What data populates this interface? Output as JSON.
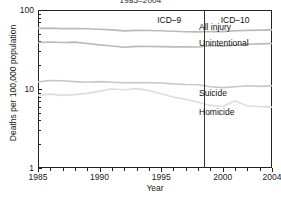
{
  "chart_data": {
    "type": "line",
    "title": "1985–2004",
    "xlabel": "Year",
    "ylabel": "Deaths per 100,000 population",
    "yscale": "log",
    "ylim": [
      1,
      100
    ],
    "xlim": [
      1985,
      2004
    ],
    "grid": false,
    "legend_position": "inline-right",
    "y_tick_labels": [
      "100",
      "10",
      "1"
    ],
    "y_tick_values": [
      100,
      10,
      1
    ],
    "y_minor_ticks": [
      20,
      30,
      40,
      50,
      60,
      70,
      80,
      90,
      2,
      3,
      4,
      5,
      6,
      7,
      8,
      9
    ],
    "x_tick_labels": [
      "1985",
      "1990",
      "1995",
      "2000",
      "2004"
    ],
    "x_tick_values": [
      1985,
      1990,
      1995,
      2000,
      2004
    ],
    "x_minor_ticks": [
      1986,
      1987,
      1988,
      1989,
      1991,
      1992,
      1993,
      1994,
      1996,
      1997,
      1998,
      1999,
      2001,
      2002,
      2003
    ],
    "annotations": [
      {
        "name": "icd9",
        "text": "ICD–9",
        "x": 1996.3,
        "y": 86
      },
      {
        "name": "icd10",
        "text": "ICD–10",
        "x": 2001.3,
        "y": 86
      }
    ],
    "vertical_divider": {
      "x": 1998.5,
      "label": "ICD revision change"
    },
    "x": [
      1985,
      1986,
      1987,
      1988,
      1989,
      1990,
      1991,
      1992,
      1993,
      1994,
      1995,
      1996,
      1997,
      1998,
      1999,
      2000,
      2001,
      2002,
      2003,
      2004
    ],
    "series": [
      {
        "name": "All injury",
        "color": "#b9b9b9",
        "values": [
          58.6,
          58.9,
          58.1,
          58.3,
          57.8,
          57.0,
          56.1,
          54.4,
          55.2,
          55.0,
          54.6,
          53.8,
          53.0,
          52.8,
          53.4,
          53.2,
          54.6,
          55.2,
          55.7,
          56.0
        ]
      },
      {
        "name": "Unintentional",
        "color": "#b9b9b9",
        "values": [
          38.8,
          39.3,
          38.8,
          39.2,
          37.6,
          36.2,
          35.0,
          33.8,
          34.6,
          34.5,
          34.4,
          34.1,
          34.3,
          34.0,
          35.4,
          34.9,
          35.8,
          36.8,
          37.3,
          37.7
        ]
      },
      {
        "name": "Suicide",
        "color": "#c7c7c7",
        "values": [
          12.3,
          12.8,
          12.7,
          12.4,
          12.2,
          12.4,
          12.2,
          12.0,
          12.1,
          12.0,
          11.9,
          11.6,
          11.4,
          11.3,
          10.7,
          10.4,
          10.7,
          11.0,
          10.8,
          11.0
        ]
      },
      {
        "name": "Homicide",
        "color": "#dddddd",
        "values": [
          8.3,
          8.6,
          8.3,
          8.5,
          8.8,
          9.4,
          10.0,
          9.8,
          10.1,
          9.6,
          8.7,
          7.9,
          7.4,
          6.8,
          6.2,
          6.0,
          7.1,
          6.1,
          6.0,
          5.9
        ]
      }
    ]
  },
  "labels": {
    "all_injury": "All injury",
    "unintentional": "Unintentional",
    "suicide": "Suicide",
    "homicide": "Homicide"
  }
}
